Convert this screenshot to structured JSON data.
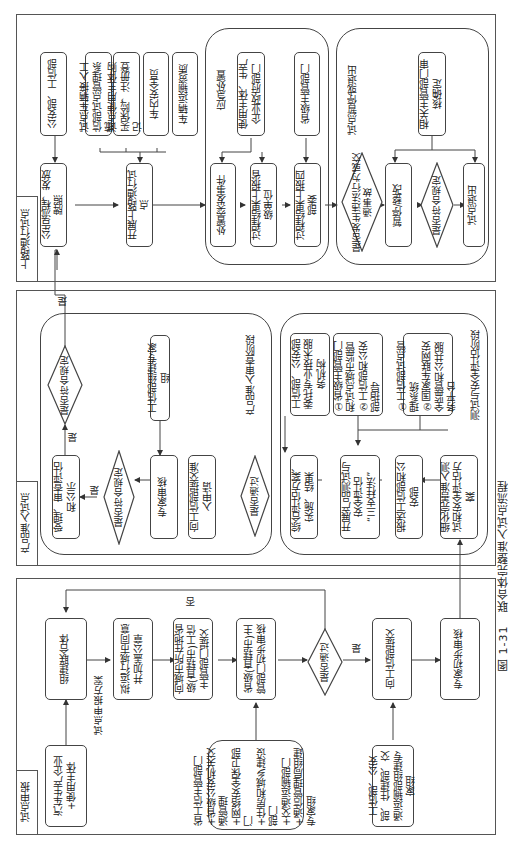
{
  "figure": {
    "caption_number": "图 1-31",
    "caption_title": "联合体完整准入试点流程"
  },
  "panels": {
    "pilot_application": {
      "title": "试点申报",
      "nodes": {
        "manufacturer_user": "汽车生产企业+使用主体",
        "form_consortium": "组建联合体",
        "city_consent": "拟运行城市同意并加盖公章",
        "submit_provincial": "向城市所在地省级(直辖市)工信主管部门提交",
        "provincial_review": "省级(直辖市)主管部门初步审核",
        "provincial_depts": "省工信主管部门\n+省级公安机关交通管理\n+网络安全保卫部门\n+住房和城乡建设部门\n+交通运输部门\n+通信管理局组建专家组",
        "passed_decision": "是否通过",
        "submit_miit": "向工信部提交",
        "ministries": "工信部、公安部、住建部、交通运输部组建专家组",
        "expert_prelim_review": "专家初步审核"
      },
      "edge_labels": {
        "plan": "试点申报方案",
        "no": "否",
        "yes": "是"
      }
    },
    "product_access_pilot": {
      "title": "产品准入试点",
      "review_stage": {
        "title": "产品准入审查阶段",
        "nodes": {
          "accept_review": "受理、审查评估和公示",
          "compliant_1": "是否符合规定",
          "compliant_2": "是否符合规定",
          "expert_review": "专家审核",
          "miit_expert_group": "工信部组建专家组",
          "submit_access": "向工信部提交准入申请"
        },
        "edge_labels": {
          "yes_1": "是",
          "yes_2": "是",
          "yes_3": "是"
        }
      },
      "passed_decision": "是否通过",
      "test_stage": {
        "title": "测试与安全评估阶段",
        "nodes": {
          "overall_assessment": "综合评估方案、实施、结果",
          "tech_agency": "工信部、公安部委托专业技术服务机构",
          "product_test": "开展产品测试与安全评估\n“三支柱法”",
          "supervision": "①省级主管部门和试点城市监管\n②工信部和公安部指导",
          "report_ministries": "报送工信部和公安部",
          "systems": "①工信部试点管理系统\n②国家车联网安全监管和公共服务平台",
          "refine_plan": "细化完善准入测试和安全评估方案"
        }
      }
    },
    "road_pilot": {
      "title": "上路通行试点",
      "nodes": {
        "announce_plates": "公告流程，发放牌照",
        "mps_miit": "公安部、工信部",
        "start_road_pilot": "开展上路通行试点",
        "vehicle_access": "试点车辆接入工信部试点管理系统",
        "insurance_register": "试点使用主体购买保险，注册登记",
        "safety_officer": "车内安全员",
        "transport_qualification": "车辆运输资质"
      },
      "emergency": {
        "title": "应急处置",
        "nodes": {
          "handle_incident": "处置突发事件",
          "user_mfr_gov": "使用主体、生产企业政府部门",
          "report_provincial": "过程结果上报省级单位",
          "provincial_dept": "省级主管部门",
          "report_four": "过程结果上报四部委"
        }
      },
      "exit": {
        "title": "试点暂停或退出",
        "nodes": {
          "violation_decision": "是否发生违法行为或交通事故",
          "suspend_rectify": "暂停/整改",
          "compliant": "是否符合规定",
          "exit_pilot": "试点退出",
          "authority_confirm": "相关主管部门审核确定"
        }
      }
    }
  }
}
